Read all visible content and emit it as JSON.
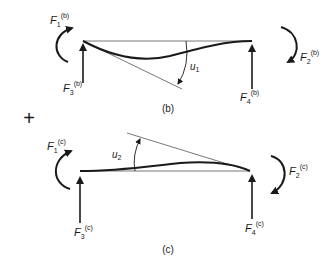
{
  "diagram": {
    "caption_b": "(b)",
    "caption_c": "(c)",
    "combine_symbol": "+",
    "stroke_color": "#1a1a1a",
    "thin_color": "#555555",
    "panel_b": {
      "moment_left": {
        "base": "F",
        "sub": "1",
        "sup": "(b)"
      },
      "moment_right": {
        "base": "F",
        "sub": "2",
        "sup": "(b)"
      },
      "force_left": {
        "base": "F",
        "sub": "3",
        "sup": "(b)"
      },
      "force_right": {
        "base": "F",
        "sub": "4",
        "sup": "(b)"
      },
      "angle": {
        "base": "u",
        "sub": "1"
      }
    },
    "panel_c": {
      "moment_left": {
        "base": "F",
        "sub": "1",
        "sup": "(c)"
      },
      "moment_right": {
        "base": "F",
        "sub": "2",
        "sup": "(c)"
      },
      "force_left": {
        "base": "F",
        "sub": "3",
        "sup": "(c)"
      },
      "force_right": {
        "base": "F",
        "sub": "4",
        "sup": "(c)"
      },
      "angle": {
        "base": "u",
        "sub": "2"
      }
    }
  }
}
